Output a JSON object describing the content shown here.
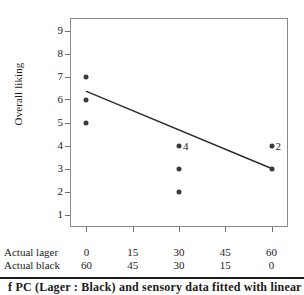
{
  "chart_data": {
    "type": "scatter",
    "title": "",
    "xlabel": "",
    "ylabel": "Overall liking",
    "ylim": [
      0.5,
      9.5
    ],
    "yticks": [
      1,
      2,
      3,
      4,
      5,
      6,
      7,
      8,
      9
    ],
    "xlim": [
      -5,
      65
    ],
    "grid": false,
    "legend": null,
    "axes": [
      {
        "name": "Actual lager",
        "ticks": [
          0,
          15,
          30,
          45,
          60
        ]
      },
      {
        "name": "Actual black",
        "ticks": [
          60,
          45,
          30,
          15,
          0
        ]
      }
    ],
    "points": [
      {
        "x": 0,
        "y": 7,
        "count": 1,
        "label": ""
      },
      {
        "x": 0,
        "y": 6,
        "count": 1,
        "label": ""
      },
      {
        "x": 0,
        "y": 5,
        "count": 1,
        "label": ""
      },
      {
        "x": 30,
        "y": 4,
        "count": 4,
        "label": "4"
      },
      {
        "x": 30,
        "y": 3,
        "count": 1,
        "label": ""
      },
      {
        "x": 30,
        "y": 2,
        "count": 1,
        "label": ""
      },
      {
        "x": 60,
        "y": 4,
        "count": 2,
        "label": "2"
      },
      {
        "x": 60,
        "y": 3,
        "count": 1,
        "label": ""
      }
    ],
    "fit_line": {
      "name": "regression line",
      "x": [
        0,
        60
      ],
      "y": [
        6.35,
        3.0
      ]
    },
    "colors": {
      "marker": "#3a3a3a",
      "line": "#2b2b2b",
      "frame": "#8a8a8a",
      "text": "#1a1a1a"
    }
  },
  "footer": {
    "rule": true,
    "caption_partial": "f PC (Lager : Black) and sensory data fitted with linear"
  }
}
